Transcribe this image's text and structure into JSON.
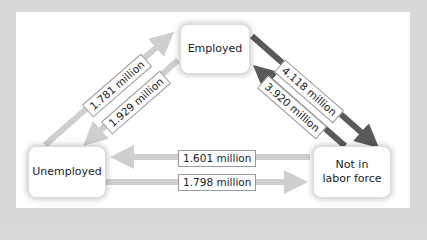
{
  "nodes": {
    "employed": "Employed",
    "unemployed": "Unemployed",
    "not_in_labor_force_line1": "Not in",
    "not_in_labor_force_line2": "labor force"
  },
  "flows": {
    "unemployed_to_employed": "1.781 million",
    "employed_to_unemployed": "1.929 million",
    "employed_to_not_in_labor_force": "4.118 million",
    "not_in_labor_force_to_employed": "3.920 million",
    "not_in_labor_force_to_unemployed": "1.601 million",
    "unemployed_to_not_in_labor_force": "1.798 million"
  },
  "colors": {
    "light_arrow": "#cfcfcf",
    "dark_arrow": "#5a5a5a",
    "frame": "#d8d8d8",
    "panel": "#ffffff"
  }
}
